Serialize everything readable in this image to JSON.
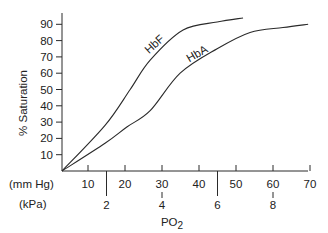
{
  "chart_data": {
    "type": "line",
    "title": "",
    "ylabel": "% Saturation",
    "xlabel": "PO2",
    "xlabel_main": "PO",
    "xlabel_sub": "2",
    "x_units": [
      "(mm Hg)",
      "(kPa)"
    ],
    "ylim": [
      0,
      100
    ],
    "xlim_mmHg": [
      3,
      70
    ],
    "grid": false,
    "legend": "inline curve labels",
    "y_ticks": [
      10,
      20,
      30,
      40,
      50,
      60,
      70,
      80,
      90
    ],
    "x_ticks_mmHg": [
      10,
      20,
      30,
      40,
      50,
      60,
      70
    ],
    "x_ticks_kPa": [
      2,
      4,
      6,
      8
    ],
    "series": [
      {
        "name": "HbF",
        "x": [
          3,
          14.6,
          21.4,
          26.8,
          35.7,
          44.9,
          51.9
        ],
        "values": [
          0,
          28,
          50,
          68,
          86.5,
          91.4,
          93.9
        ]
      },
      {
        "name": "HbA",
        "x": [
          3,
          14.6,
          20.5,
          26.8,
          34.9,
          44.9,
          53.8,
          62.7,
          69.5
        ],
        "values": [
          0,
          17,
          27,
          37,
          60,
          75,
          85,
          88,
          90
        ]
      }
    ]
  },
  "labels": {
    "ylabel": "% Saturation",
    "unit_mmhg": "(mm Hg)",
    "unit_kpa": "(kPa)",
    "xlabel_main": "PO",
    "xlabel_sub": "2",
    "hbf": "HbF",
    "hba": "HbA"
  }
}
